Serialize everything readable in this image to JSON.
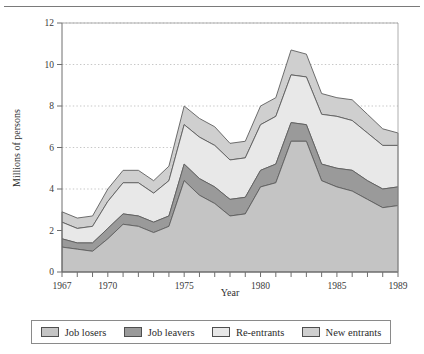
{
  "figure": {
    "axis_titles": {
      "x": "Year",
      "y": "Millions of persons"
    }
  },
  "legend": {
    "items": [
      {
        "label": "Job losers",
        "color": "#c4c4c4",
        "name": "legend-job-losers"
      },
      {
        "label": "Job leavers",
        "color": "#9a9a9a",
        "name": "legend-job-leavers"
      },
      {
        "label": "Re-entrants",
        "color": "#e8e8e8",
        "name": "legend-re-entrants"
      },
      {
        "label": "New entrants",
        "color": "#cfcfcf",
        "name": "legend-new-entrants"
      }
    ]
  },
  "chart_data": {
    "type": "area",
    "title": "",
    "xlabel": "Year",
    "ylabel": "Millions of persons",
    "stacked": true,
    "grid": true,
    "legend_position": "bottom",
    "xlim": [
      1967,
      1989
    ],
    "ylim": [
      0,
      12
    ],
    "yticks": [
      0,
      2,
      4,
      6,
      8,
      10,
      12
    ],
    "xticks": [
      1967,
      1968,
      1969,
      1970,
      1971,
      1972,
      1973,
      1974,
      1975,
      1976,
      1977,
      1978,
      1979,
      1980,
      1981,
      1982,
      1983,
      1984,
      1985,
      1986,
      1987,
      1988,
      1989
    ],
    "xtick_labels_shown": [
      1967,
      1970,
      1975,
      1980,
      1985,
      1989
    ],
    "x": [
      1967,
      1968,
      1969,
      1970,
      1971,
      1972,
      1973,
      1974,
      1975,
      1976,
      1977,
      1978,
      1979,
      1980,
      1981,
      1982,
      1983,
      1984,
      1985,
      1986,
      1987,
      1988,
      1989
    ],
    "series": [
      {
        "name": "Job losers",
        "color": "#c4c4c4",
        "values": [
          1.2,
          1.1,
          1.0,
          1.6,
          2.3,
          2.2,
          1.9,
          2.2,
          4.4,
          3.7,
          3.3,
          2.7,
          2.8,
          4.1,
          4.3,
          6.3,
          6.3,
          4.4,
          4.1,
          3.9,
          3.5,
          3.1,
          3.2
        ]
      },
      {
        "name": "Job leavers",
        "color": "#9a9a9a",
        "values": [
          0.4,
          0.3,
          0.4,
          0.5,
          0.5,
          0.5,
          0.5,
          0.5,
          0.8,
          0.8,
          0.8,
          0.8,
          0.8,
          0.8,
          0.9,
          0.9,
          0.8,
          0.8,
          0.9,
          1.0,
          0.9,
          0.9,
          0.9
        ]
      },
      {
        "name": "Re-entrants",
        "color": "#e8e8e8",
        "values": [
          0.8,
          0.7,
          0.8,
          1.3,
          1.5,
          1.6,
          1.4,
          1.7,
          1.9,
          2.0,
          2.0,
          1.9,
          1.9,
          2.2,
          2.3,
          2.3,
          2.3,
          2.4,
          2.5,
          2.4,
          2.3,
          2.1,
          2.0
        ]
      },
      {
        "name": "New entrants",
        "color": "#cfcfcf",
        "values": [
          0.5,
          0.5,
          0.5,
          0.6,
          0.6,
          0.6,
          0.6,
          0.7,
          0.9,
          0.9,
          0.9,
          0.8,
          0.8,
          0.9,
          0.9,
          1.2,
          1.1,
          1.0,
          0.9,
          1.0,
          0.9,
          0.8,
          0.6
        ]
      }
    ],
    "totals": [
      2.9,
      2.6,
      2.7,
      4.0,
      4.9,
      4.9,
      4.4,
      5.1,
      8.0,
      7.4,
      7.0,
      6.2,
      6.3,
      8.0,
      8.4,
      10.7,
      10.5,
      8.6,
      8.4,
      8.3,
      7.6,
      6.9,
      6.7
    ]
  }
}
